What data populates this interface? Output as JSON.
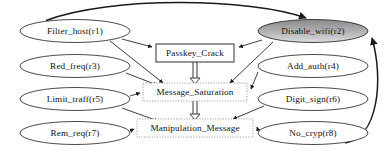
{
  "diagram": {
    "background_color": "#ffffff",
    "stroke_color": "#1a1a1a",
    "text_color": "#111111",
    "ellipse_fill": "#ffffff",
    "highlight_fill_top": "#8f8f8f",
    "highlight_fill_bottom": "#d8d8d8",
    "dotted_border_color": "#aaaaaa",
    "nodes": [
      {
        "id": "r1",
        "label": "Filter_host(r1)",
        "shape": "ellipse",
        "style": "plain",
        "cx": 75,
        "cy": 31,
        "rx": 55,
        "ry": 11.5
      },
      {
        "id": "r3",
        "label": "Red_freq(r3)",
        "shape": "ellipse",
        "style": "plain",
        "cx": 75,
        "cy": 66,
        "rx": 55,
        "ry": 11.5
      },
      {
        "id": "r5",
        "label": "Limit_traff(r5)",
        "shape": "ellipse",
        "style": "plain",
        "cx": 75,
        "cy": 99,
        "rx": 55,
        "ry": 11.5
      },
      {
        "id": "r7",
        "label": "Rem_req(r7)",
        "shape": "ellipse",
        "style": "plain",
        "cx": 75,
        "cy": 133,
        "rx": 55,
        "ry": 11.5
      },
      {
        "id": "r2",
        "label": "Disable_wifi(r2)",
        "shape": "ellipse",
        "style": "highlighted",
        "cx": 313,
        "cy": 31,
        "rx": 55,
        "ry": 11.5
      },
      {
        "id": "r4",
        "label": "Add_auth(r4)",
        "shape": "ellipse",
        "style": "plain",
        "cx": 313,
        "cy": 66,
        "rx": 55,
        "ry": 11.5
      },
      {
        "id": "r6",
        "label": "Digit_sign(r6)",
        "shape": "ellipse",
        "style": "plain",
        "cx": 313,
        "cy": 99,
        "rx": 55,
        "ry": 11.5
      },
      {
        "id": "r8",
        "label": "No_cryp(r8)",
        "shape": "ellipse",
        "style": "plain",
        "cx": 313,
        "cy": 133,
        "rx": 55,
        "ry": 11.5
      },
      {
        "id": "passkey_crack",
        "label": "Passkey_Crack",
        "shape": "rect",
        "style": "solid",
        "x": 156,
        "y": 44,
        "w": 78,
        "h": 18
      },
      {
        "id": "message_saturation",
        "label": "Message_Saturation",
        "shape": "rect",
        "style": "dotted",
        "x": 143,
        "y": 83,
        "w": 104,
        "h": 18
      },
      {
        "id": "manipulation_message",
        "label": "Manipulation_Message",
        "shape": "rect",
        "style": "dotted",
        "x": 137,
        "y": 119,
        "w": 116,
        "h": 18
      }
    ],
    "edges": [
      {
        "id": "e1",
        "from": "r1",
        "to": "r2",
        "kind": "curved-top"
      },
      {
        "id": "e2",
        "from": "r1",
        "to": "passkey_crack",
        "kind": "line"
      },
      {
        "id": "e3",
        "from": "r1",
        "to": "message_saturation",
        "kind": "line"
      },
      {
        "id": "e4",
        "from": "r3",
        "to": "message_saturation",
        "kind": "line"
      },
      {
        "id": "e5",
        "from": "r5",
        "to": "message_saturation",
        "kind": "line"
      },
      {
        "id": "e6",
        "from": "r5",
        "to": "manipulation_message",
        "kind": "line"
      },
      {
        "id": "e7",
        "from": "r7",
        "to": "manipulation_message",
        "kind": "line"
      },
      {
        "id": "e8",
        "from": "r2",
        "to": "passkey_crack",
        "kind": "line"
      },
      {
        "id": "e9",
        "from": "r2",
        "to": "message_saturation",
        "kind": "line"
      },
      {
        "id": "e10",
        "from": "r4",
        "to": "message_saturation",
        "kind": "line"
      },
      {
        "id": "e11",
        "from": "r6",
        "to": "manipulation_message",
        "kind": "line"
      },
      {
        "id": "e12",
        "from": "r8",
        "to": "manipulation_message",
        "kind": "line"
      },
      {
        "id": "e13",
        "from": "r8",
        "to": "r2",
        "kind": "curved-right"
      },
      {
        "id": "e14",
        "from": "passkey_crack",
        "to": "message_saturation",
        "kind": "double"
      },
      {
        "id": "e15",
        "from": "message_saturation",
        "to": "manipulation_message",
        "kind": "double"
      }
    ]
  }
}
